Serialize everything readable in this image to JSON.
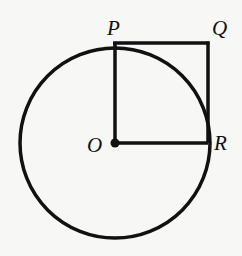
{
  "diagram": {
    "type": "geometry",
    "circle": {
      "center": "O",
      "cx": 115,
      "cy": 143,
      "r": 95
    },
    "points": {
      "P": {
        "label": "P",
        "x": 115,
        "y": 43
      },
      "Q": {
        "label": "Q",
        "x": 208,
        "y": 43
      },
      "R": {
        "label": "R",
        "x": 208,
        "y": 143
      },
      "O": {
        "label": "O",
        "x": 115,
        "y": 143
      }
    },
    "segments": [
      "OP",
      "PQ",
      "QR",
      "OR"
    ],
    "colors": {
      "stroke": "#111111",
      "background": "#f7f7f5"
    }
  }
}
